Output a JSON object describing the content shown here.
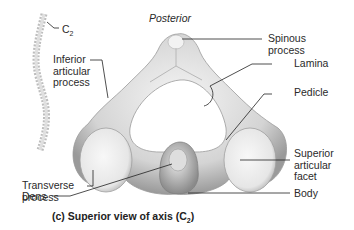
{
  "figure": {
    "orientation_label": "Posterior",
    "caption_prefix": "(c) Superior view of axis (C",
    "caption_sub": "2",
    "caption_suffix": ")",
    "spine_label_prefix": "C",
    "spine_label_sub": "2"
  },
  "labels": {
    "inferior_articular_process": "Inferior\narticular\nprocess",
    "transverse_process": "Transverse\nprocess",
    "dens": "Dens",
    "spinous_process": "Spinous\nprocess",
    "lamina": "Lamina",
    "pedicle": "Pedicle",
    "superior_articular_facet": "Superior\narticular\nfacet",
    "body": "Body"
  },
  "colors": {
    "bone_light": "#eeeeee",
    "bone_mid": "#c9c9c9",
    "bone_dark": "#8e8e8e",
    "leader_line": "#222222"
  }
}
